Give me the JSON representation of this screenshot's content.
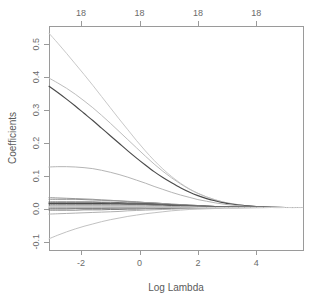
{
  "chart_data": {
    "type": "line",
    "title": "",
    "xlabel": "Log Lambda",
    "ylabel": "Coefficients",
    "xlim": [
      -3.1,
      5.6
    ],
    "ylim": [
      -0.125,
      0.555
    ],
    "grid": false,
    "legend": "none",
    "x_ticks": [
      -2,
      0,
      2,
      4
    ],
    "x_tick_labels": [
      "-2",
      "0",
      "2",
      "4"
    ],
    "y_ticks": [
      -0.1,
      0.0,
      0.1,
      0.2,
      0.3,
      0.4,
      0.5
    ],
    "y_tick_labels": [
      "-0.1",
      "0.0",
      "0.1",
      "0.2",
      "0.3",
      "0.4",
      "0.5"
    ],
    "top_axis": {
      "label": "Number of nonzero coefficients",
      "ticks": [
        -2,
        0,
        2,
        4
      ],
      "tick_labels": [
        "18",
        "18",
        "18",
        "18"
      ]
    },
    "x": [
      -3.1,
      -2.8,
      -2.5,
      -2.2,
      -1.9,
      -1.6,
      -1.3,
      -1.0,
      -0.7,
      -0.4,
      -0.1,
      0.2,
      0.5,
      0.8,
      1.1,
      1.4,
      1.7,
      2.0,
      2.3,
      2.6,
      2.9,
      3.2,
      3.6,
      4.0,
      4.5,
      5.0,
      5.6
    ],
    "series": [
      {
        "name": "coef-1",
        "color": "#c9c9c9",
        "width": 1.0,
        "values": [
          0.533,
          0.503,
          0.472,
          0.44,
          0.408,
          0.375,
          0.341,
          0.307,
          0.273,
          0.24,
          0.207,
          0.176,
          0.147,
          0.121,
          0.098,
          0.078,
          0.061,
          0.047,
          0.036,
          0.027,
          0.02,
          0.015,
          0.01,
          0.007,
          0.005,
          0.004,
          0.004
        ]
      },
      {
        "name": "coef-2",
        "color": "#bdbdbd",
        "width": 1.0,
        "values": [
          0.397,
          0.382,
          0.366,
          0.348,
          0.328,
          0.307,
          0.284,
          0.26,
          0.235,
          0.21,
          0.185,
          0.16,
          0.136,
          0.114,
          0.094,
          0.076,
          0.06,
          0.047,
          0.036,
          0.027,
          0.02,
          0.015,
          0.01,
          0.007,
          0.005,
          0.004,
          0.004
        ]
      },
      {
        "name": "coef-3",
        "color": "#4a4a4a",
        "width": 1.15,
        "values": [
          0.372,
          0.353,
          0.333,
          0.312,
          0.29,
          0.268,
          0.245,
          0.222,
          0.199,
          0.176,
          0.154,
          0.133,
          0.113,
          0.095,
          0.079,
          0.064,
          0.051,
          0.04,
          0.031,
          0.024,
          0.018,
          0.014,
          0.01,
          0.007,
          0.005,
          0.004,
          0.004
        ]
      },
      {
        "name": "coef-4",
        "color": "#b5b5b5",
        "width": 1.0,
        "values": [
          0.127,
          0.128,
          0.128,
          0.127,
          0.125,
          0.122,
          0.117,
          0.111,
          0.104,
          0.096,
          0.087,
          0.078,
          0.068,
          0.059,
          0.05,
          0.042,
          0.035,
          0.028,
          0.023,
          0.018,
          0.014,
          0.011,
          0.008,
          0.006,
          0.005,
          0.004,
          0.004
        ]
      },
      {
        "name": "coef-5",
        "color": "#8f8f8f",
        "width": 1.0,
        "values": [
          0.029,
          0.029,
          0.029,
          0.029,
          0.028,
          0.027,
          0.026,
          0.025,
          0.024,
          0.022,
          0.021,
          0.019,
          0.018,
          0.016,
          0.014,
          0.013,
          0.011,
          0.01,
          0.008,
          0.007,
          0.006,
          0.006,
          0.005,
          0.005,
          0.004,
          0.004,
          0.004
        ]
      },
      {
        "name": "coef-6",
        "color": "#6e6e6e",
        "width": 1.0,
        "values": [
          0.021,
          0.021,
          0.021,
          0.021,
          0.021,
          0.021,
          0.02,
          0.02,
          0.019,
          0.018,
          0.018,
          0.017,
          0.016,
          0.015,
          0.013,
          0.012,
          0.011,
          0.01,
          0.008,
          0.007,
          0.006,
          0.006,
          0.005,
          0.005,
          0.004,
          0.004,
          0.004
        ]
      },
      {
        "name": "coef-7",
        "color": "#3c3c3c",
        "width": 1.1,
        "values": [
          0.016,
          0.016,
          0.016,
          0.016,
          0.016,
          0.016,
          0.016,
          0.016,
          0.016,
          0.015,
          0.015,
          0.015,
          0.014,
          0.013,
          0.012,
          0.011,
          0.01,
          0.009,
          0.008,
          0.007,
          0.006,
          0.006,
          0.005,
          0.005,
          0.004,
          0.004,
          0.004
        ]
      },
      {
        "name": "coef-8",
        "color": "#5a5a5a",
        "width": 1.0,
        "values": [
          0.012,
          0.012,
          0.012,
          0.012,
          0.012,
          0.012,
          0.012,
          0.012,
          0.012,
          0.012,
          0.012,
          0.012,
          0.011,
          0.011,
          0.01,
          0.01,
          0.009,
          0.008,
          0.007,
          0.007,
          0.006,
          0.005,
          0.005,
          0.004,
          0.004,
          0.004,
          0.004
        ]
      },
      {
        "name": "coef-9",
        "color": "#a0a0a0",
        "width": 1.0,
        "values": [
          0.008,
          0.008,
          0.008,
          0.008,
          0.008,
          0.008,
          0.008,
          0.008,
          0.008,
          0.008,
          0.008,
          0.008,
          0.008,
          0.008,
          0.007,
          0.007,
          0.007,
          0.007,
          0.006,
          0.006,
          0.005,
          0.005,
          0.005,
          0.004,
          0.004,
          0.004,
          0.004
        ]
      },
      {
        "name": "coef-10",
        "color": "#8a8a8a",
        "width": 1.0,
        "values": [
          0.002,
          0.002,
          0.002,
          0.002,
          0.002,
          0.002,
          0.002,
          0.002,
          0.003,
          0.003,
          0.003,
          0.003,
          0.003,
          0.003,
          0.003,
          0.003,
          0.003,
          0.004,
          0.004,
          0.004,
          0.004,
          0.004,
          0.004,
          0.004,
          0.004,
          0.004,
          0.004
        ]
      },
      {
        "name": "coef-11",
        "color": "#7d7d7d",
        "width": 1.0,
        "values": [
          -0.004,
          -0.004,
          -0.004,
          -0.004,
          -0.003,
          -0.003,
          -0.003,
          -0.002,
          -0.002,
          -0.001,
          -0.001,
          0.0,
          0.0,
          0.001,
          0.001,
          0.002,
          0.002,
          0.003,
          0.003,
          0.003,
          0.004,
          0.004,
          0.004,
          0.004,
          0.004,
          0.004,
          0.004
        ]
      },
      {
        "name": "coef-12",
        "color": "#b0b0b0",
        "width": 1.0,
        "values": [
          -0.016,
          -0.015,
          -0.014,
          -0.013,
          -0.012,
          -0.011,
          -0.01,
          -0.009,
          -0.008,
          -0.006,
          -0.005,
          -0.004,
          -0.003,
          -0.002,
          -0.001,
          0.0,
          0.001,
          0.001,
          0.002,
          0.002,
          0.003,
          0.003,
          0.003,
          0.004,
          0.004,
          0.004,
          0.004
        ]
      },
      {
        "name": "coef-13",
        "color": "#c2c2c2",
        "width": 1.0,
        "values": [
          -0.091,
          -0.08,
          -0.07,
          -0.061,
          -0.053,
          -0.046,
          -0.039,
          -0.033,
          -0.028,
          -0.023,
          -0.019,
          -0.015,
          -0.012,
          -0.009,
          -0.006,
          -0.004,
          -0.002,
          -0.001,
          0.0,
          0.001,
          0.002,
          0.002,
          0.003,
          0.003,
          0.004,
          0.004,
          0.004
        ]
      },
      {
        "name": "coef-14",
        "color": "#ababab",
        "width": 1.0,
        "values": [
          0.004,
          0.004,
          0.004,
          0.004,
          0.004,
          0.004,
          0.004,
          0.004,
          0.004,
          0.004,
          0.004,
          0.004,
          0.004,
          0.004,
          0.004,
          0.004,
          0.004,
          0.004,
          0.004,
          0.004,
          0.004,
          0.004,
          0.004,
          0.004,
          0.004,
          0.004,
          0.004
        ]
      },
      {
        "name": "coef-15",
        "color": "#999999",
        "width": 1.0,
        "values": [
          0.034,
          0.033,
          0.032,
          0.031,
          0.03,
          0.029,
          0.027,
          0.026,
          0.024,
          0.023,
          0.021,
          0.019,
          0.018,
          0.016,
          0.014,
          0.013,
          0.011,
          0.01,
          0.008,
          0.007,
          0.006,
          0.006,
          0.005,
          0.005,
          0.004,
          0.004,
          0.004
        ]
      },
      {
        "name": "coef-16",
        "color": "#848484",
        "width": 1.0,
        "values": [
          0.0,
          0.0,
          0.0,
          0.001,
          0.001,
          0.001,
          0.001,
          0.002,
          0.002,
          0.002,
          0.002,
          0.003,
          0.003,
          0.003,
          0.003,
          0.003,
          0.004,
          0.004,
          0.004,
          0.004,
          0.004,
          0.004,
          0.004,
          0.004,
          0.004,
          0.004,
          0.004
        ]
      },
      {
        "name": "coef-17",
        "color": "#666666",
        "width": 1.0,
        "values": [
          0.018,
          0.018,
          0.018,
          0.018,
          0.018,
          0.018,
          0.018,
          0.017,
          0.017,
          0.016,
          0.016,
          0.015,
          0.014,
          0.013,
          0.012,
          0.011,
          0.01,
          0.009,
          0.008,
          0.007,
          0.006,
          0.006,
          0.005,
          0.005,
          0.004,
          0.004,
          0.004
        ]
      },
      {
        "name": "coef-18",
        "color": "#d0d0d0",
        "width": 1.0,
        "values": [
          0.006,
          0.006,
          0.006,
          0.006,
          0.006,
          0.006,
          0.006,
          0.006,
          0.006,
          0.006,
          0.006,
          0.005,
          0.005,
          0.005,
          0.005,
          0.005,
          0.005,
          0.004,
          0.004,
          0.004,
          0.004,
          0.004,
          0.004,
          0.004,
          0.004,
          0.004,
          0.004
        ]
      }
    ]
  },
  "layout": {
    "plot_left": 49,
    "plot_right": 303,
    "plot_top": 26,
    "plot_bottom": 250
  }
}
